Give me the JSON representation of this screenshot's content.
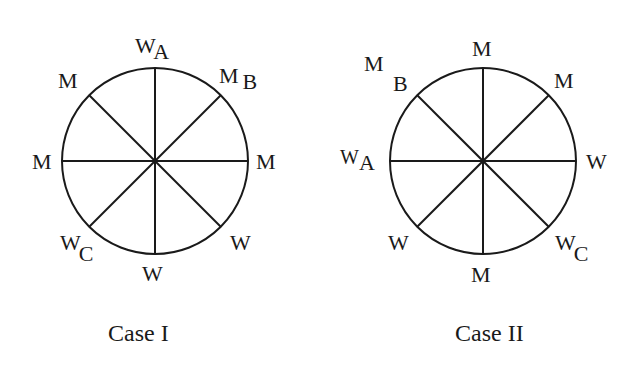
{
  "diagrams": [
    {
      "caption": "Case I",
      "labels": {
        "top": {
          "main": "W",
          "sub": "A"
        },
        "top_right": {
          "main": "M",
          "sub": "B"
        },
        "right": {
          "main": "M",
          "sub": ""
        },
        "bottom_right": {
          "main": "W",
          "sub": ""
        },
        "bottom": {
          "main": "W",
          "sub": ""
        },
        "bottom_left": {
          "main": "W",
          "sub": "C"
        },
        "left": {
          "main": "M",
          "sub": ""
        },
        "top_left": {
          "main": "M",
          "sub": ""
        }
      }
    },
    {
      "caption": "Case II",
      "labels": {
        "top": {
          "main": "M",
          "sub": ""
        },
        "top_right": {
          "main": "M",
          "sub": ""
        },
        "right": {
          "main": "W",
          "sub": ""
        },
        "bottom_right": {
          "main": "W",
          "sub": "C"
        },
        "bottom": {
          "main": "M",
          "sub": ""
        },
        "bottom_left": {
          "main": "W",
          "sub": ""
        },
        "left": {
          "main": "W",
          "sub": "A"
        },
        "top_left": {
          "main": "M",
          "sub": "B"
        }
      }
    }
  ]
}
